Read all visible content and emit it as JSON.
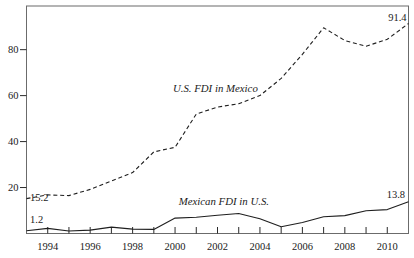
{
  "chart_data": {
    "type": "line",
    "x": [
      1993,
      1994,
      1995,
      1996,
      1997,
      1998,
      1999,
      2000,
      2001,
      2002,
      2003,
      2004,
      2005,
      2006,
      2007,
      2008,
      2009,
      2010,
      2011
    ],
    "series": [
      {
        "name": "U.S. FDI in Mexico",
        "line_style": "dashed",
        "values": [
          15.2,
          16.8,
          16.5,
          19.2,
          22.8,
          26.5,
          35.5,
          37.5,
          52.0,
          55.0,
          56.5,
          60.0,
          67.5,
          78.0,
          89.5,
          84.0,
          81.5,
          84.5,
          91.4
        ]
      },
      {
        "name": "Mexican FDI in U.S.",
        "line_style": "solid",
        "values": [
          1.2,
          2.2,
          1.1,
          1.5,
          2.8,
          1.9,
          1.8,
          6.7,
          7.1,
          7.9,
          8.7,
          6.4,
          2.9,
          4.8,
          7.3,
          7.8,
          9.9,
          10.4,
          13.8
        ]
      }
    ],
    "xlim": [
      1993,
      2011
    ],
    "ylim": [
      0,
      99
    ],
    "yticks": [
      20,
      40,
      60,
      80
    ],
    "xtick_labels": [
      1994,
      1996,
      1998,
      2000,
      2002,
      2004,
      2006,
      2008,
      2010
    ],
    "x_minor_tick_every_year": true,
    "grid": false,
    "legend": "inline-series-labels",
    "series_labels": [
      {
        "text": "U.S. FDI in Mexico",
        "year": 2001.9,
        "value": 61.7,
        "anchor": "middle"
      },
      {
        "text": "Mexican FDI in U.S.",
        "year": 2002.3,
        "value": 12.2,
        "anchor": "middle"
      }
    ],
    "point_labels": [
      {
        "text": "15.2",
        "year": 1993,
        "value": 15.2,
        "dx": 3.5,
        "dy": 2.5,
        "anchor": "start"
      },
      {
        "text": "1.2",
        "year": 1993,
        "value": 1.2,
        "dx": 3.5,
        "dy": -8,
        "anchor": "start"
      },
      {
        "text": "91.4",
        "year": 2011,
        "value": 91.4,
        "dx": -2,
        "dy": -2,
        "anchor": "end"
      },
      {
        "text": "13.8",
        "year": 2011,
        "value": 13.8,
        "dx": -3.5,
        "dy": -3.5,
        "anchor": "end"
      }
    ],
    "colors": {
      "line": "#1f1f1f",
      "frame": "#6b6b6b",
      "tick": "#2a2a2a",
      "text": "#1a1a1a",
      "background": "#ffffff"
    }
  }
}
